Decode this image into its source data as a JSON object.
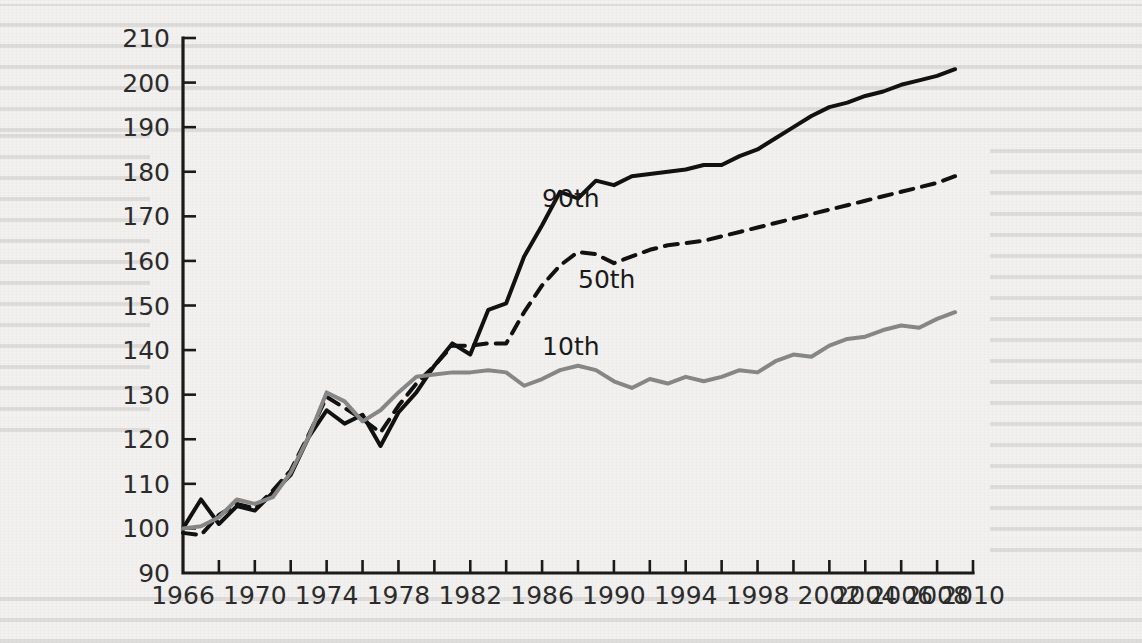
{
  "chart_data": {
    "type": "line",
    "title": "",
    "subtitle": "",
    "xlabel": "",
    "ylabel": "",
    "xlim": [
      1966,
      2010
    ],
    "ylim": [
      90,
      210
    ],
    "grid": false,
    "legend_position": "inline-labels",
    "y_ticks": [
      90,
      100,
      110,
      120,
      130,
      140,
      150,
      160,
      170,
      180,
      190,
      200,
      210
    ],
    "x_ticks": [
      1966,
      1968,
      1970,
      1972,
      1974,
      1976,
      1978,
      1980,
      1982,
      1984,
      1986,
      1988,
      1990,
      1992,
      1994,
      1996,
      1998,
      2000,
      2002,
      2004,
      2006,
      2008,
      2010
    ],
    "x_tick_labels": [
      "1966",
      "",
      "1970",
      "",
      "1974",
      "",
      "1978",
      "",
      "1982",
      "",
      "1986",
      "",
      "1990",
      "",
      "1994",
      "",
      "1998",
      "",
      "2002",
      "2004",
      "2006",
      "2008",
      "2010"
    ],
    "x": [
      1966,
      1967,
      1968,
      1969,
      1970,
      1971,
      1972,
      1973,
      1974,
      1975,
      1976,
      1977,
      1978,
      1979,
      1980,
      1981,
      1982,
      1983,
      1984,
      1985,
      1986,
      1987,
      1988,
      1989,
      1990,
      1991,
      1992,
      1993,
      1994,
      1995,
      1996,
      1997,
      1998,
      1999,
      2000,
      2001,
      2002,
      2003,
      2004,
      2005,
      2006,
      2007,
      2008,
      2009
    ],
    "series": [
      {
        "name": "90th",
        "label": "90th",
        "style": "solid",
        "color": "#111111",
        "width": 4.0,
        "label_x": 1986,
        "label_y": 172,
        "values": [
          100.0,
          106.5,
          101.0,
          105.0,
          104.0,
          108.0,
          112.0,
          120.5,
          126.5,
          123.5,
          125.5,
          118.5,
          126.0,
          130.5,
          136.5,
          141.5,
          139.0,
          149.0,
          150.5,
          161.0,
          168.0,
          175.5,
          174.0,
          178.0,
          177.0,
          179.0,
          179.5,
          180.0,
          180.5,
          181.5,
          181.5,
          183.5,
          185.0,
          187.5,
          190.0,
          192.5,
          194.5,
          195.5,
          197.0,
          198.0,
          199.5,
          200.5,
          201.5,
          203.0
        ]
      },
      {
        "name": "50th",
        "label": "50th",
        "style": "dashed",
        "color": "#111111",
        "width": 4.0,
        "dash": "13,9",
        "label_x": 1988,
        "label_y": 154,
        "values": [
          99.0,
          98.5,
          103.0,
          105.5,
          104.5,
          108.5,
          113.0,
          121.0,
          129.5,
          127.0,
          124.5,
          121.5,
          127.5,
          132.5,
          136.5,
          141.0,
          141.0,
          141.5,
          141.5,
          148.5,
          154.5,
          159.0,
          162.0,
          161.5,
          159.5,
          161.0,
          162.5,
          163.5,
          164.0,
          164.5,
          165.5,
          166.5,
          167.5,
          168.5,
          169.5,
          170.5,
          171.5,
          172.5,
          173.5,
          174.5,
          175.5,
          176.5,
          177.5,
          179.0
        ]
      },
      {
        "name": "10th",
        "label": "10th",
        "style": "solid",
        "color": "#868686",
        "width": 4.0,
        "label_x": 1986,
        "label_y": 139,
        "values": [
          100.0,
          100.5,
          102.5,
          106.5,
          105.5,
          107.0,
          112.5,
          120.5,
          130.5,
          128.5,
          124.0,
          126.5,
          130.5,
          134.0,
          134.5,
          135.0,
          135.0,
          135.5,
          135.0,
          132.0,
          133.5,
          135.5,
          136.5,
          135.5,
          133.0,
          131.5,
          133.5,
          132.5,
          134.0,
          133.0,
          134.0,
          135.5,
          135.0,
          137.5,
          139.0,
          138.5,
          141.0,
          142.5,
          143.0,
          144.5,
          145.5,
          145.0,
          147.0,
          148.5
        ]
      }
    ]
  },
  "axis": {
    "y_axis_name": "y-axis",
    "x_axis_name": "x-axis"
  }
}
